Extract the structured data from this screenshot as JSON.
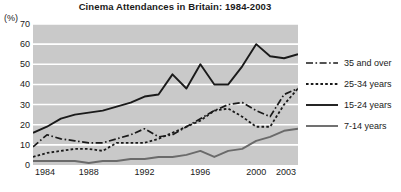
{
  "chart_data": {
    "type": "line",
    "title": "Cinema Attendances in Britain: 1984-2003",
    "xlabel": "",
    "ylabel": "(%)",
    "ylim": [
      0,
      70
    ],
    "yticks": [
      0,
      10,
      20,
      30,
      40,
      50,
      60,
      70
    ],
    "grid": "horizontal",
    "legend_position": "right",
    "x": [
      1984,
      1985,
      1986,
      1987,
      1988,
      1989,
      1990,
      1991,
      1992,
      1993,
      1994,
      1995,
      1996,
      1997,
      1998,
      1999,
      2000,
      2001,
      2002,
      2003
    ],
    "xtick_labels": [
      "1984",
      "1988",
      "1992",
      "1996",
      "2000",
      "2003"
    ],
    "xtick_values": [
      1984,
      1988,
      1992,
      1996,
      2000,
      2003
    ],
    "series": [
      {
        "name": "35 and over",
        "style": "dash-dot",
        "color": "#1a1a1a",
        "values": [
          9,
          15,
          13,
          12,
          11,
          11,
          13,
          15,
          18,
          14,
          15,
          19,
          23,
          27,
          30,
          31,
          27,
          24,
          35,
          38
        ]
      },
      {
        "name": "25-34 years",
        "style": "dotted",
        "color": "#1a1a1a",
        "values": [
          4,
          6,
          7,
          8,
          8,
          7,
          11,
          11,
          11,
          13,
          16,
          19,
          22,
          27,
          28,
          24,
          19,
          19,
          30,
          38
        ]
      },
      {
        "name": "15-24 years",
        "style": "solid",
        "color": "#1a1a1a",
        "values": [
          16,
          19,
          23,
          25,
          26,
          27,
          29,
          31,
          34,
          35,
          45,
          38,
          50,
          40,
          40,
          49,
          60,
          54,
          53,
          55
        ]
      },
      {
        "name": "7-14 years",
        "style": "solid-grey",
        "color": "#6a6a6a",
        "values": [
          2,
          2,
          2,
          2,
          1,
          2,
          2,
          3,
          3,
          4,
          4,
          5,
          7,
          4,
          7,
          8,
          12,
          14,
          17,
          18
        ]
      }
    ]
  },
  "legend": {
    "items": [
      {
        "label": "35 and over"
      },
      {
        "label": "25-34 years"
      },
      {
        "label": "15-24 years"
      },
      {
        "label": "7-14 years"
      }
    ]
  }
}
